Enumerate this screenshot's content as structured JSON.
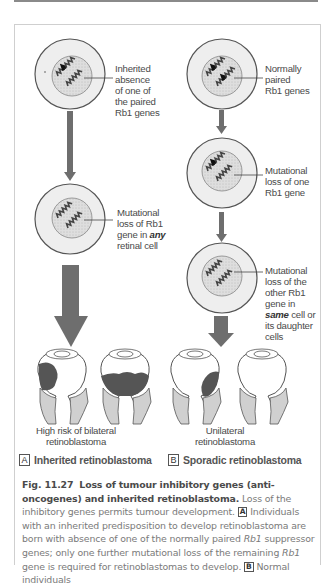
{
  "figure": {
    "colors": {
      "cytoplasm": "#ededed",
      "cell_outline": "#555555",
      "nucleus": "#d9d9d9",
      "arrow": "#6e6e6e",
      "tumour": "#555555",
      "eye_stalk": "#d0d0d0",
      "caption_text": "#7a7a7a",
      "caption_bold": "#4a4a4a"
    },
    "left_column": {
      "cell1_label": [
        "Inherited",
        "absence",
        "of one of",
        "the paired",
        "Rb1 genes"
      ],
      "cell2_label_lines": [
        "Mutational",
        "loss of Rb1",
        "gene in ",
        "any",
        "retinal cell"
      ],
      "outcome": [
        "High risk of bilateral",
        "retinoblastoma"
      ],
      "legend_letter": "A",
      "legend_text": "Inherited retinoblastoma"
    },
    "right_column": {
      "cell1_label": [
        "Normally",
        "paired",
        "Rb1 genes"
      ],
      "cell2_label": [
        "Mutational",
        "loss of one",
        "Rb1 gene"
      ],
      "cell3_label_lines": [
        "Mutational",
        "loss of the",
        "other Rb1",
        "gene in",
        "same",
        " cell or",
        "its daughter",
        "cells"
      ],
      "outcome": [
        "Unilateral",
        "retinoblastoma"
      ],
      "legend_letter": "B",
      "legend_text": "Sporadic retinoblastoma"
    },
    "caption": {
      "fig_number": "Fig. 11.27",
      "title": "Loss of tumour inhibitory genes (anti-oncogenes) and inherited retinoblastoma.",
      "text1": " Loss of the inhibitory genes permits tumour development. ",
      "box_a": "A",
      "text2": " Individuals with an inherited predisposition to develop retinoblastoma are born with absence of one of the normally paired ",
      "gene1": "Rb1",
      "text3": " suppressor genes; only one further mutational loss of the remaining ",
      "gene2": "Rb1",
      "text4": " gene is required for retinoblastomas to develop. ",
      "box_b": "B",
      "text5": " Normal individuals"
    }
  }
}
